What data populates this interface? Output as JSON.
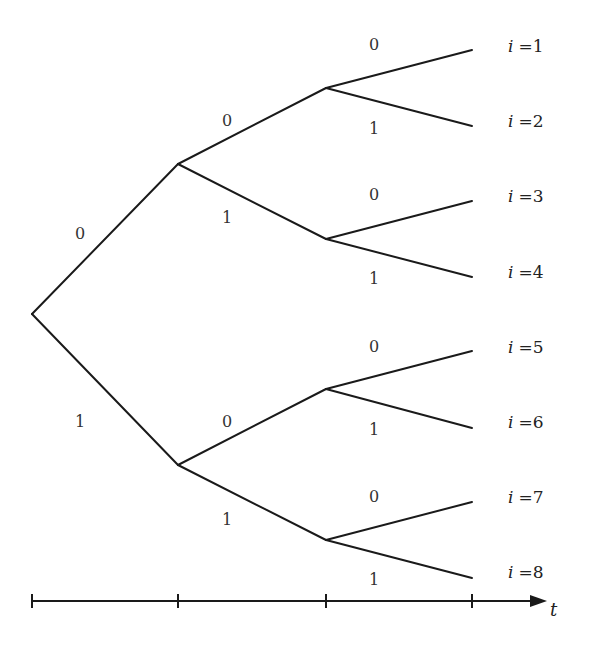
{
  "nodes": {
    "root": {
      "x": 32,
      "y": 314
    },
    "level1": [
      {
        "x": 178,
        "y": 164
      },
      {
        "x": 178,
        "y": 465
      }
    ],
    "level2": [
      {
        "x": 326,
        "y": 88
      },
      {
        "x": 326,
        "y": 239
      },
      {
        "x": 326,
        "y": 389
      },
      {
        "x": 326,
        "y": 540
      }
    ],
    "leaves": [
      {
        "x": 472,
        "y": 50
      },
      {
        "x": 472,
        "y": 126
      },
      {
        "x": 472,
        "y": 201
      },
      {
        "x": 472,
        "y": 277
      },
      {
        "x": 472,
        "y": 351
      },
      {
        "x": 472,
        "y": 428
      },
      {
        "x": 472,
        "y": 502
      },
      {
        "x": 472,
        "y": 578
      }
    ]
  },
  "edge_labels": {
    "level0": [
      "0",
      "1"
    ],
    "level1": [
      "0",
      "1",
      "0",
      "1"
    ],
    "level2": [
      "0",
      "1",
      "0",
      "1",
      "0",
      "1",
      "0",
      "1"
    ]
  },
  "leaf_labels": [
    {
      "var": "i",
      "eq": "=1"
    },
    {
      "var": "i",
      "eq": "=2"
    },
    {
      "var": "i",
      "eq": "=3"
    },
    {
      "var": "i",
      "eq": "=4"
    },
    {
      "var": "i",
      "eq": "=5"
    },
    {
      "var": "i",
      "eq": "=6"
    },
    {
      "var": "i",
      "eq": "=7"
    },
    {
      "var": "i",
      "eq": "=8"
    }
  ],
  "axis": {
    "label": "t",
    "y": 600,
    "ticks_x": [
      32,
      178,
      326,
      472
    ],
    "arrow_end_x": 545
  }
}
